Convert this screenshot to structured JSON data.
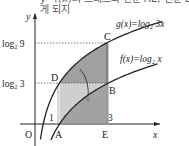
{
  "top_text": {
    "line1": "y=f(x)의 그래프와 선분 AE, 선분 EB로 둘",
    "line2": "게 되지"
  },
  "axes": {
    "x_label": "x",
    "y_label": "y",
    "origin_label": "O"
  },
  "curves": {
    "g_label": "g(x)=log₂ 3x",
    "f_label": "f(x)=log₂ x"
  },
  "ticks": {
    "x1": "1",
    "x3": "3",
    "y_log9": "log₂ 9",
    "y_log3": "log₂ 3"
  },
  "points": {
    "A": "A",
    "B": "B",
    "C": "C",
    "D": "D",
    "E": "E"
  },
  "colors": {
    "dark_region": "#8f8f8f",
    "light_region": "#cfcfcf",
    "line": "#222222"
  }
}
